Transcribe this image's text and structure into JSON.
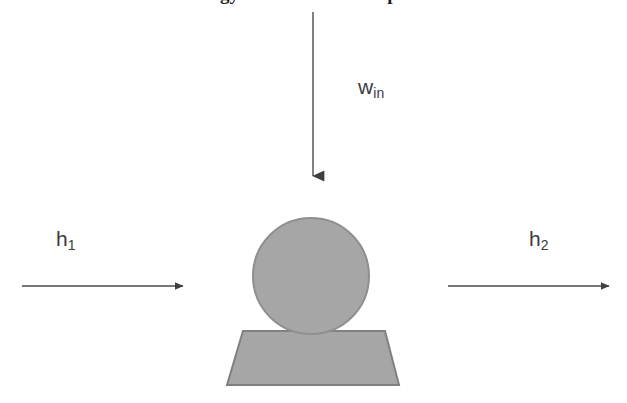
{
  "figure": {
    "title_clipped": "Energy balance for a compressor",
    "background_color": "#ffffff",
    "shape_fill_color": "#a6a6a6",
    "shape_stroke_color": "#808080",
    "arrow_color": "#3f3f3f",
    "label_color": "#3b3b3b"
  },
  "labels": {
    "inlet_enthalpy": {
      "base": "h",
      "sub": "1"
    },
    "outlet_enthalpy": {
      "base": "h",
      "sub": "2"
    },
    "work_input": {
      "base": "w",
      "sub": "in"
    }
  },
  "arrows": [
    {
      "name": "work-input-arrow",
      "direction": "down",
      "x1": 313,
      "y1": 12,
      "x2": 313,
      "y2": 178
    },
    {
      "name": "inlet-flow-arrow",
      "direction": "right",
      "x1": 22,
      "y1": 286,
      "x2": 184,
      "y2": 286
    },
    {
      "name": "outlet-flow-arrow",
      "direction": "right",
      "x1": 448,
      "y1": 286,
      "x2": 610,
      "y2": 286
    }
  ],
  "shapes": {
    "compressor_body": {
      "name": "circle",
      "cx": 311,
      "cy": 276,
      "r": 58
    },
    "compressor_base": {
      "name": "trapezoid",
      "top_left": 243,
      "top_right": 385,
      "bottom_left": 227,
      "bottom_right": 399,
      "top_y": 331,
      "bottom_y": 385
    }
  }
}
